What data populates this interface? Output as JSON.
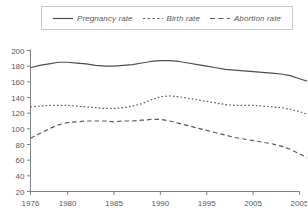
{
  "chart_data": {
    "type": "line",
    "title": "",
    "xlabel": "",
    "ylabel": "",
    "grid": false,
    "legend_position": "top",
    "ylim": [
      20,
      200
    ],
    "yticks": [
      20,
      40,
      60,
      80,
      100,
      120,
      140,
      160,
      180,
      200
    ],
    "xlim": [
      1976,
      2005
    ],
    "xtick_labels": [
      "1976",
      "1980",
      "1985",
      "1990",
      "1995",
      "2005",
      "2005"
    ],
    "xtick_positions": [
      1976,
      1980,
      1985,
      1990,
      1995,
      2000,
      2005
    ],
    "x": [
      1976,
      1977,
      1978,
      1979,
      1980,
      1981,
      1982,
      1983,
      1984,
      1985,
      1986,
      1987,
      1988,
      1989,
      1990,
      1991,
      1992,
      1993,
      1994,
      1995,
      1996,
      1997,
      1998,
      1999,
      2000,
      2001,
      2002,
      2003,
      2004,
      2005,
      2006
    ],
    "series": [
      {
        "name": "Pregnancy rate",
        "style": "solid",
        "color": "#4d4d4f",
        "values": [
          178,
          181,
          183,
          185,
          185,
          184,
          183,
          181,
          180,
          180,
          181,
          182,
          184,
          186,
          187,
          187,
          186,
          184,
          182,
          180,
          178,
          176,
          175,
          174,
          173,
          172,
          171,
          170,
          168,
          164,
          160
        ]
      },
      {
        "name": "Birth rate",
        "style": "dotted",
        "color": "#58585a",
        "values": [
          128,
          129,
          130,
          130,
          130,
          129,
          128,
          127,
          126,
          126,
          127,
          129,
          132,
          137,
          141,
          142,
          141,
          139,
          137,
          135,
          133,
          131,
          130,
          130,
          130,
          129,
          128,
          127,
          125,
          122,
          118
        ]
      },
      {
        "name": "Abortion rate",
        "style": "dashed",
        "color": "#58585a",
        "values": [
          88,
          94,
          100,
          105,
          108,
          109,
          110,
          110,
          110,
          109,
          110,
          110,
          111,
          112,
          112,
          110,
          107,
          104,
          101,
          98,
          95,
          92,
          89,
          87,
          85,
          83,
          81,
          78,
          74,
          68,
          62
        ]
      }
    ]
  },
  "legend": {
    "entries": [
      {
        "label": "Pregnancy rate",
        "style": "solid"
      },
      {
        "label": "Birth rate",
        "style": "dotted"
      },
      {
        "label": "Abortion rate",
        "style": "dashed"
      }
    ]
  },
  "colors": {
    "line": "#4d4d4f",
    "axis": "#808080",
    "text": "#58585a",
    "legend_border": "#c9c9c9",
    "background": "#ffffff"
  }
}
